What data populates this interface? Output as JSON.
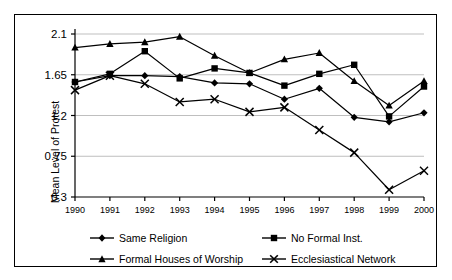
{
  "chart_data": {
    "type": "line",
    "title": "",
    "xlabel": "",
    "ylabel": "Mean Level of Protest",
    "categories": [
      "1990",
      "1991",
      "1992",
      "1993",
      "1994",
      "1995",
      "1996",
      "1997",
      "1998",
      "1999",
      "2000"
    ],
    "x": [
      1990,
      1991,
      1992,
      1993,
      1994,
      1995,
      1996,
      1997,
      1998,
      1999,
      2000
    ],
    "ylim": [
      0.3,
      2.1
    ],
    "yticks": [
      0.3,
      0.75,
      1.2,
      1.65,
      2.1
    ],
    "ytick_labels": [
      "0.3",
      "0.75",
      "1.2",
      "1.65",
      "2.1"
    ],
    "grid": "horizontal",
    "legend_position": "bottom",
    "series": [
      {
        "name": "Same Religion",
        "marker": "diamond",
        "values": [
          1.57,
          1.64,
          1.64,
          1.63,
          1.56,
          1.55,
          1.38,
          1.5,
          1.18,
          1.13,
          1.23
        ]
      },
      {
        "name": "No Formal Inst.",
        "marker": "square",
        "values": [
          1.57,
          1.66,
          1.91,
          1.61,
          1.72,
          1.67,
          1.53,
          1.66,
          1.76,
          1.19,
          1.52
        ]
      },
      {
        "name": "Formal Houses of Worship",
        "marker": "triangle",
        "values": [
          1.95,
          1.99,
          2.01,
          2.07,
          1.86,
          1.67,
          1.82,
          1.89,
          1.58,
          1.31,
          1.58
        ]
      },
      {
        "name": "Ecclesiastical Network",
        "marker": "cross",
        "values": [
          1.48,
          1.64,
          1.55,
          1.35,
          1.38,
          1.24,
          1.29,
          1.04,
          0.79,
          0.38,
          0.59
        ]
      }
    ]
  },
  "legend": {
    "items": [
      {
        "label": "Same Religion",
        "marker": "diamond"
      },
      {
        "label": "No Formal Inst.",
        "marker": "square"
      },
      {
        "label": "Formal Houses of Worship",
        "marker": "triangle"
      },
      {
        "label": "Ecclesiastical Network",
        "marker": "cross"
      }
    ]
  },
  "axis": {
    "y_title": "Mean Level of Protest"
  },
  "colors": {
    "series_line": "#000000",
    "grid": "#bfbfbf",
    "axis": "#000000",
    "background": "#ffffff"
  }
}
